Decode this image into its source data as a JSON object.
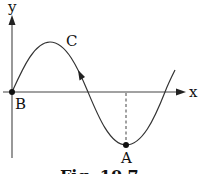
{
  "figure": {
    "caption": "Fig. 10.7",
    "axes": {
      "x_label": "x",
      "y_label": "y"
    },
    "points": {
      "origin": "B",
      "crest": "C",
      "trough": "A"
    },
    "curve": {
      "shape": "sine wave",
      "direction_arrow": "up-left on descending segment between C and axis crossing"
    },
    "colors": {
      "stroke": "#222222",
      "background": "#ffffff"
    }
  }
}
